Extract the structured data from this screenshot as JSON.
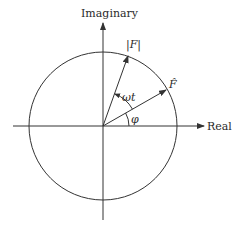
{
  "diagram": {
    "axes": {
      "x_label": "Real",
      "y_label": "Imaginary"
    },
    "circle": {
      "label": "unit circle"
    },
    "vectors": [
      {
        "name": "magnitude",
        "label": "|F|"
      },
      {
        "name": "phasor",
        "label": "F̂"
      }
    ],
    "angles": [
      {
        "name": "omega-t",
        "label": "ωt"
      },
      {
        "name": "phi",
        "label": "φ"
      }
    ],
    "colors": {
      "stroke": "#333333",
      "text": "#2a2a2a",
      "background": "#ffffff"
    }
  }
}
